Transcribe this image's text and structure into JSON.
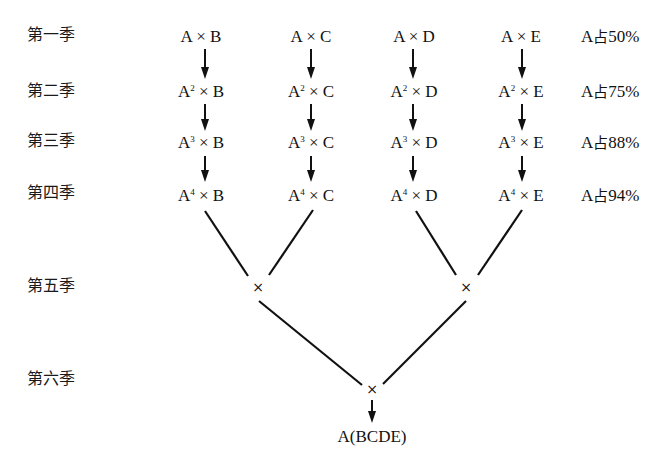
{
  "diagram": {
    "generations": [
      {
        "label": "第一季",
        "y": 28
      },
      {
        "label": "第二季",
        "y": 84
      },
      {
        "label": "第三季",
        "y": 134
      },
      {
        "label": "第四季",
        "y": 186
      },
      {
        "label": "第五季",
        "y": 279
      },
      {
        "label": "第六季",
        "y": 373
      }
    ],
    "columns": [
      {
        "partner": "B",
        "x": 200
      },
      {
        "partner": "C",
        "x": 310
      },
      {
        "partner": "D",
        "x": 414
      },
      {
        "partner": "E",
        "x": 521
      }
    ],
    "rows": [
      {
        "base": "A",
        "exp": "",
        "cells": [
          "A × B",
          "A × C",
          "A × D",
          "A × E"
        ],
        "proportion": "A占50%",
        "pct_prefix": "A",
        "pct_cjk": "占",
        "pct_value": "50%"
      },
      {
        "base": "A",
        "exp": "2",
        "cells": [
          "A² × B",
          "A² × C",
          "A² × D",
          "A² × E"
        ],
        "proportion": "A占75%",
        "pct_prefix": "A",
        "pct_cjk": "占",
        "pct_value": "75%"
      },
      {
        "base": "A",
        "exp": "3",
        "cells": [
          "A³ × B",
          "A³ × C",
          "A³ × D",
          "A³ × E"
        ],
        "proportion": "A占88%",
        "pct_prefix": "A",
        "pct_cjk": "占",
        "pct_value": "88%"
      },
      {
        "base": "A",
        "exp": "4",
        "cells": [
          "A⁴ × B",
          "A⁴ × C",
          "A⁴ × D",
          "A⁴ × E"
        ],
        "proportion": "A占94%",
        "pct_prefix": "A",
        "pct_cjk": "占",
        "pct_value": "94%"
      }
    ],
    "cross_symbol": "×",
    "gen5_crosses": [
      {
        "symbol": "×",
        "x": 258,
        "y": 287,
        "parents": [
          "A⁴ × B",
          "A⁴ × C"
        ]
      },
      {
        "symbol": "×",
        "x": 466,
        "y": 287,
        "parents": [
          "A⁴ × D",
          "A⁴ × E"
        ]
      }
    ],
    "gen6_cross": {
      "symbol": "×",
      "x": 372,
      "y": 389
    },
    "result": {
      "label": "A(BCDE)",
      "x": 372,
      "y": 431
    },
    "line_color": "#111111"
  }
}
